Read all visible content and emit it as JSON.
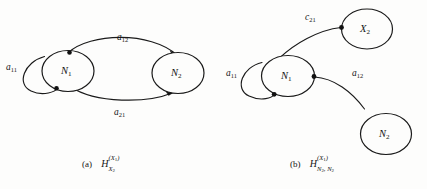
{
  "figure": {
    "background_color": "#fdfdfc",
    "ink_color": "#1a1a1a",
    "panels": [
      {
        "id": "panel-a",
        "caption_tag": "(a)",
        "caption_base": "H",
        "caption_superscript_main": "(X",
        "caption_superscript_sub": "1",
        "caption_superscript_close": ")",
        "caption_subscript_main": "X",
        "caption_subscript_sub": "2",
        "nodes": [
          {
            "id": "n1",
            "label_base": "N",
            "label_sub": "1"
          },
          {
            "id": "n2",
            "label_base": "N",
            "label_sub": "2"
          }
        ],
        "edges": [
          {
            "id": "self-loop-a11",
            "label_base": "a",
            "label_sub": "11"
          },
          {
            "id": "top-edge-a12",
            "label_base": "a",
            "label_sub": "12"
          },
          {
            "id": "bottom-edge-a21",
            "label_base": "a",
            "label_sub": "21"
          }
        ]
      },
      {
        "id": "panel-b",
        "caption_tag": "(b)",
        "caption_base": "H",
        "caption_superscript_main": "(X",
        "caption_superscript_sub": "1",
        "caption_superscript_close": ")",
        "caption_subscript_main": "N",
        "caption_subscript_sub": "2",
        "caption_subscript_main2": ", N",
        "caption_subscript_sub2": "2",
        "nodes": [
          {
            "id": "n1b",
            "label_base": "N",
            "label_sub": "1"
          },
          {
            "id": "x2b",
            "label_base": "X",
            "label_sub": "2"
          },
          {
            "id": "n2b",
            "label_base": "N",
            "label_sub": "2"
          }
        ],
        "edges": [
          {
            "id": "self-loop-a11-b",
            "label_base": "a",
            "label_sub": "11"
          },
          {
            "id": "upper-edge-c21",
            "label_base": "c",
            "label_sub": "21"
          },
          {
            "id": "lower-edge-a12",
            "label_base": "a",
            "label_sub": "12"
          }
        ]
      }
    ]
  },
  "labels": {
    "a_n1": {
      "base": "N",
      "sub": "1"
    },
    "a_n2": {
      "base": "N",
      "sub": "2"
    },
    "a_a11": {
      "base": "a",
      "sub": "11"
    },
    "a_a12": {
      "base": "a",
      "sub": "12"
    },
    "a_a21": {
      "base": "a",
      "sub": "21"
    },
    "b_n1": {
      "base": "N",
      "sub": "1"
    },
    "b_x2": {
      "base": "X",
      "sub": "2"
    },
    "b_n2": {
      "base": "N",
      "sub": "2"
    },
    "b_a11": {
      "base": "a",
      "sub": "11"
    },
    "b_c21": {
      "base": "c",
      "sub": "21"
    },
    "b_a12": {
      "base": "a",
      "sub": "12"
    }
  },
  "captions": {
    "a_tag": "(a)",
    "a_base": "H",
    "a_sup_pre": "(X",
    "a_sup_sub": "1",
    "a_sup_post": ")",
    "a_sub_pre": "X",
    "a_sub_sub": "2",
    "b_tag": "(b)",
    "b_base": "H",
    "b_sup_pre": "(X",
    "b_sup_sub": "1",
    "b_sup_post": ")",
    "b_sub_pre": "N",
    "b_sub_sub": "2",
    "b_sub_pre2": ", N",
    "b_sub_sub2": "2"
  }
}
